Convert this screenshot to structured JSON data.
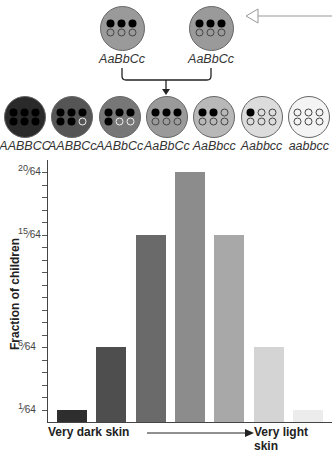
{
  "parents": [
    {
      "genotype": "AaBbCc",
      "dots": [
        "f",
        "f",
        "f",
        "o",
        "o",
        "o"
      ],
      "color": "#9a9a9a"
    },
    {
      "genotype": "AaBbCc",
      "dots": [
        "f",
        "f",
        "f",
        "o",
        "o",
        "o"
      ],
      "color": "#9a9a9a"
    }
  ],
  "offspring": [
    {
      "genotype": "AABBCC",
      "dots": [
        "f",
        "f",
        "f",
        "f",
        "f",
        "f"
      ],
      "color": "#2a2a2a"
    },
    {
      "genotype": "AABBCc",
      "dots": [
        "f",
        "f",
        "f",
        "f",
        "f",
        "o"
      ],
      "color": "#555555"
    },
    {
      "genotype": "AABbCc",
      "dots": [
        "f",
        "f",
        "f",
        "f",
        "o",
        "o"
      ],
      "color": "#777777"
    },
    {
      "genotype": "AaBbCc",
      "dots": [
        "f",
        "f",
        "f",
        "o",
        "o",
        "o"
      ],
      "color": "#9a9a9a"
    },
    {
      "genotype": "AaBbcc",
      "dots": [
        "f",
        "f",
        "o",
        "o",
        "o",
        "o"
      ],
      "color": "#b8b8b8"
    },
    {
      "genotype": "Aabbcc",
      "dots": [
        "f",
        "o",
        "o",
        "o",
        "o",
        "o"
      ],
      "color": "#dcdcdc"
    },
    {
      "genotype": "aabbcc",
      "dots": [
        "o",
        "o",
        "o",
        "o",
        "o",
        "o"
      ],
      "color": "#f4f4f4"
    }
  ],
  "chart_data": {
    "type": "bar",
    "title": "",
    "categories": [
      "AABBCC",
      "AABBCc",
      "AABbCc",
      "AaBbCc",
      "AaBbcc",
      "Aabbcc",
      "aabbcc"
    ],
    "values": [
      1,
      6,
      15,
      20,
      15,
      6,
      1
    ],
    "value_unit": "/64",
    "ylabel": "Fraction of children",
    "xlabel_left": "Very dark skin",
    "xlabel_right": "Very light skin",
    "ylim": [
      0,
      20
    ],
    "yticks_labeled": [
      "1/64",
      "6/64",
      "15/64",
      "20/64"
    ],
    "bar_colors": [
      "#2e2e2e",
      "#4e4e4e",
      "#6a6a6a",
      "#8c8c8c",
      "#a8a8a8",
      "#d4d4d4",
      "#ececec"
    ],
    "grid": false
  },
  "axis": {
    "ylabel": "Fraction of children",
    "xlabel_left": "Very dark skin",
    "xlabel_right": "Very light skin",
    "ticks": [
      {
        "num": "20",
        "den": "64",
        "value": 20
      },
      {
        "num": "15",
        "den": "64",
        "value": 15
      },
      {
        "num": "6",
        "den": "64",
        "value": 6
      },
      {
        "num": "1",
        "den": "64",
        "value": 1
      }
    ]
  }
}
